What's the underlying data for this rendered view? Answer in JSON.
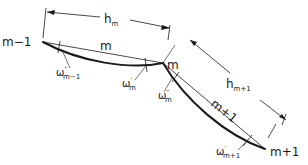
{
  "diagram": {
    "type": "beam-segment-geometry",
    "colors": {
      "ink": "#1a1a1a",
      "background": "#ffffff"
    },
    "nodes": [
      {
        "id": "m-1",
        "label": "m−1",
        "x": 43,
        "y": 42
      },
      {
        "id": "m",
        "label": "m",
        "x": 163,
        "y": 63
      },
      {
        "id": "m+1",
        "label": "m+1",
        "x": 265,
        "y": 149
      }
    ],
    "members": [
      {
        "id": "m",
        "label": "m",
        "from": "m-1",
        "to": "m"
      },
      {
        "id": "m+1",
        "label": "m+1",
        "from": "m",
        "to": "m+1"
      }
    ],
    "dimensions": [
      {
        "id": "h_m",
        "base": "h",
        "sub": "m"
      },
      {
        "id": "h_m+1",
        "base": "h",
        "sub": "m+1"
      }
    ],
    "angles": [
      {
        "id": "omega_m-1_pp",
        "base": "ω",
        "sup": "″",
        "sub": "m−1"
      },
      {
        "id": "omega_m_p",
        "base": "ω",
        "sup": "′",
        "sub": "m"
      },
      {
        "id": "omega_m_pp",
        "base": "ω",
        "sup": "″",
        "sub": "m"
      },
      {
        "id": "omega_m+1_p",
        "base": "ω",
        "sup": "′",
        "sub": "m+1"
      }
    ]
  }
}
